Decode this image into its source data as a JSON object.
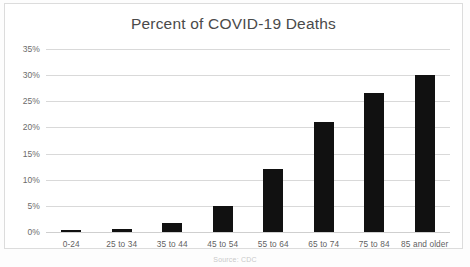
{
  "chart_data": {
    "type": "bar",
    "title": "Percent of COVID-19 Deaths",
    "xlabel": "",
    "ylabel": "",
    "categories": [
      "0-24",
      "25 to 34",
      "35 to 44",
      "45 to 54",
      "55 to 64",
      "65 to 74",
      "75 to 84",
      "85 and older"
    ],
    "values": [
      0.3,
      0.6,
      1.7,
      4.9,
      12.0,
      21.0,
      26.6,
      30.0
    ],
    "ylim": [
      0,
      35
    ],
    "ytick_labels": [
      "0%",
      "5%",
      "10%",
      "15%",
      "20%",
      "25%",
      "30%",
      "35%"
    ],
    "ytick_values": [
      0,
      5,
      10,
      15,
      20,
      25,
      30,
      35
    ],
    "grid": "horizontal",
    "legend": "none",
    "bar_color": "#111111",
    "gridline_color": "#d9d9d9",
    "title_color": "#4a4a4a",
    "series": [
      {
        "name": "Percent of COVID-19 Deaths",
        "values": [
          0.3,
          0.6,
          1.7,
          4.9,
          12.0,
          21.0,
          26.6,
          30.0
        ]
      }
    ]
  },
  "footer": {
    "source_note": "Source: CDC"
  }
}
